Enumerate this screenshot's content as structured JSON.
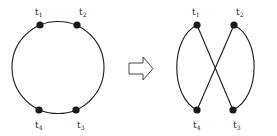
{
  "colors": {
    "stroke": "#1a1a1a",
    "node": "#1a1a1a",
    "arrow_stroke": "#444444",
    "background": "#ffffff"
  },
  "left_figure": {
    "shape": "circle",
    "nodes": [
      {
        "id": "t1",
        "base": "t",
        "sub": "1",
        "x": 40,
        "y": 25,
        "label_pos": "above"
      },
      {
        "id": "t2",
        "base": "t",
        "sub": "2",
        "x": 77,
        "y": 25,
        "label_pos": "above"
      },
      {
        "id": "t3",
        "base": "t",
        "sub": "3",
        "x": 76,
        "y": 110,
        "label_pos": "below"
      },
      {
        "id": "t4",
        "base": "t",
        "sub": "4",
        "x": 39,
        "y": 110,
        "label_pos": "below"
      }
    ]
  },
  "arrow": {
    "direction": "right",
    "style": "hollow"
  },
  "right_figure": {
    "shape": "figure-eight (crossed)",
    "nodes": [
      {
        "id": "t1",
        "base": "t",
        "sub": "1",
        "x": 197,
        "y": 25,
        "label_pos": "above"
      },
      {
        "id": "t2",
        "base": "t",
        "sub": "2",
        "x": 234,
        "y": 25,
        "label_pos": "above"
      },
      {
        "id": "t3",
        "base": "t",
        "sub": "3",
        "x": 233,
        "y": 110,
        "label_pos": "below"
      },
      {
        "id": "t4",
        "base": "t",
        "sub": "4",
        "x": 197,
        "y": 110,
        "label_pos": "below"
      }
    ],
    "edges": [
      {
        "from": "t1",
        "to": "t4",
        "type": "arc-left"
      },
      {
        "from": "t2",
        "to": "t3",
        "type": "arc-right"
      },
      {
        "from": "t1",
        "to": "t3",
        "type": "line"
      },
      {
        "from": "t2",
        "to": "t4",
        "type": "line"
      }
    ]
  }
}
